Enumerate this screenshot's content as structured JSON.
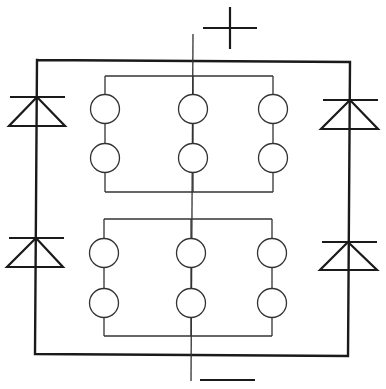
{
  "diagram": {
    "colors": {
      "line": "#1a1a1a",
      "thin_line": "#333333",
      "background": "#ffffff"
    },
    "terminals": {
      "positive": {
        "label": "+",
        "symbol": "plus",
        "cx": 230,
        "cy": 28,
        "half_w": 27,
        "half_h": 21
      },
      "negative": {
        "label": "−",
        "symbol": "minus",
        "x1": 200,
        "x2": 255,
        "y": 380
      }
    },
    "outer_loop": {
      "points": [
        [
          37,
          60
        ],
        [
          350,
          62
        ],
        [
          348,
          356
        ],
        [
          35,
          354
        ],
        [
          37,
          60
        ]
      ]
    },
    "center_wire": {
      "x_top": 193,
      "y_top": 34,
      "x_bottom": 191,
      "y_bottom": 381
    },
    "diodes": [
      {
        "id": "diode-top-left",
        "apex": [
          37,
          97
        ],
        "bar_x1": 10,
        "bar_x2": 65,
        "base_y": 126,
        "base_x1": 9,
        "base_x2": 65
      },
      {
        "id": "diode-top-right",
        "apex": [
          350,
          100
        ],
        "bar_x1": 323,
        "bar_x2": 378,
        "base_y": 129,
        "base_x1": 321,
        "base_x2": 378
      },
      {
        "id": "diode-bottom-left",
        "apex": [
          36,
          238
        ],
        "bar_x1": 9,
        "bar_x2": 64,
        "base_y": 267,
        "base_x1": 7,
        "base_x2": 63
      },
      {
        "id": "diode-bottom-right",
        "apex": [
          348,
          242
        ],
        "bar_x1": 322,
        "bar_x2": 377,
        "base_y": 270,
        "base_x1": 320,
        "base_x2": 377
      }
    ],
    "banks": [
      {
        "id": "upper-bank",
        "top_y": 76,
        "bottom_y": 192,
        "columns_x": [
          105,
          193,
          273
        ],
        "rows_y": [
          109,
          158
        ],
        "radius": 14.5
      },
      {
        "id": "lower-bank",
        "top_y": 219,
        "bottom_y": 336,
        "columns_x": [
          104,
          191,
          272
        ],
        "rows_y": [
          253,
          303
        ],
        "radius": 14.5
      }
    ]
  }
}
